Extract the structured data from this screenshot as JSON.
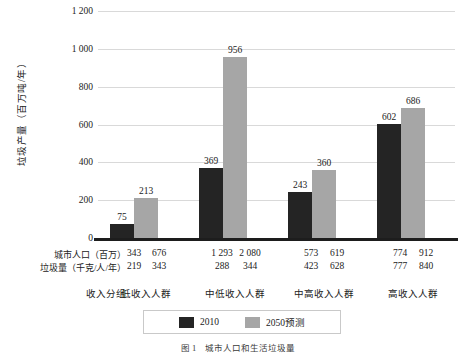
{
  "chart_data": {
    "type": "bar",
    "title": "",
    "xlabel": "收入分组",
    "ylabel": "垃圾产量（百万吨/年）",
    "ylim": [
      0,
      1200
    ],
    "yticks": [
      "0",
      "200",
      "400",
      "600",
      "800",
      "1 000",
      "1 200"
    ],
    "ytick_values": [
      0,
      200,
      400,
      600,
      800,
      1000,
      1200
    ],
    "grid": true,
    "legend_position": "bottom",
    "categories": [
      "低收入人群",
      "中低收入人群",
      "中高收入人群",
      "高收入人群"
    ],
    "series": [
      {
        "name": "2010",
        "color": "#242424",
        "values": [
          75,
          369,
          243,
          602
        ]
      },
      {
        "name": "2050预测",
        "color": "#a6a6a6",
        "values": [
          213,
          956,
          360,
          686
        ]
      }
    ],
    "table_rows": [
      {
        "label": "城市人口（百万）",
        "values": [
          [
            "343",
            "676"
          ],
          [
            "1 293",
            "2 080"
          ],
          [
            "573",
            "619"
          ],
          [
            "774",
            "912"
          ]
        ]
      },
      {
        "label": "垃圾量（千克/人/年）",
        "values": [
          [
            "219",
            "343"
          ],
          [
            "288",
            "344"
          ],
          [
            "423",
            "628"
          ],
          [
            "777",
            "840"
          ]
        ]
      }
    ]
  },
  "axis": {
    "y_title": "垃圾产量（百万吨/年）",
    "group_row_title": "收入分组"
  },
  "legend": {
    "items": [
      {
        "label": "2010",
        "color": "#242424"
      },
      {
        "label": "2050预测",
        "color": "#a6a6a6"
      }
    ]
  },
  "caption": {
    "text": "图 1　城市人口和生活垃圾量"
  }
}
